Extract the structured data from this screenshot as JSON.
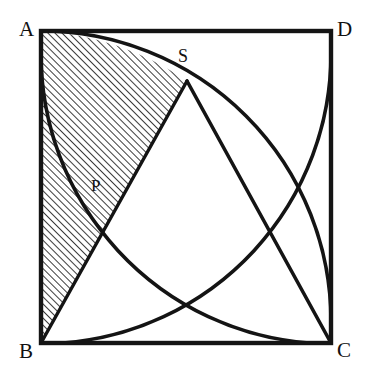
{
  "figure": {
    "background_color": "#ffffff",
    "stroke_color": "#141414",
    "hatch_color": "#1a1a1a",
    "square": {
      "name": "ABCD",
      "left": 41,
      "top": 31,
      "right": 331,
      "bottom": 343,
      "side_px": 290,
      "border_width_px": 4
    },
    "vertices": [
      {
        "id": "A",
        "label": "A",
        "position": "top-left",
        "x": 41,
        "y": 31
      },
      {
        "id": "D",
        "label": "D",
        "position": "top-right",
        "x": 331,
        "y": 31
      },
      {
        "id": "B",
        "label": "B",
        "position": "bottom-left",
        "x": 41,
        "y": 343
      },
      {
        "id": "C",
        "label": "C",
        "position": "bottom-right",
        "x": 331,
        "y": 343
      }
    ],
    "points": [
      {
        "id": "S",
        "label": "S",
        "x": 187,
        "y": 81,
        "description": "intersection of arcs near top"
      },
      {
        "id": "P",
        "label": "P",
        "x": 101,
        "y": 226,
        "description": "intersection of arc and chord BS"
      }
    ],
    "arcs": [
      {
        "id": "arc-B-A-to-C",
        "center": "B",
        "from": "A",
        "to": "C",
        "radius_px": 290
      },
      {
        "id": "arc-C-B-to-D",
        "center": "C",
        "from": "B",
        "to": "D",
        "radius_px": 290
      },
      {
        "id": "arc-D-A-to-C",
        "center": "D",
        "from": "A",
        "to": "C",
        "radius_px": 290
      },
      {
        "id": "arc-A-B-to-D",
        "center": "A",
        "from": "B",
        "to": "D",
        "radius_px": 290
      }
    ],
    "chords": [
      {
        "id": "chord-S-B",
        "from": "S",
        "to": "B"
      },
      {
        "id": "chord-S-C",
        "from": "S",
        "to": "C"
      }
    ],
    "shaded_region": {
      "id": "lune-A-S-P-B",
      "fill": "diagonal-hatch",
      "hatch_angle_deg": 45,
      "hatch_spacing_px": 5,
      "hatch_line_width_px": 1.6,
      "boundary": [
        "A",
        "S",
        "P",
        "B"
      ],
      "description": "region bounded by side AB, arc A-to-S, chord S-to-B"
    }
  }
}
